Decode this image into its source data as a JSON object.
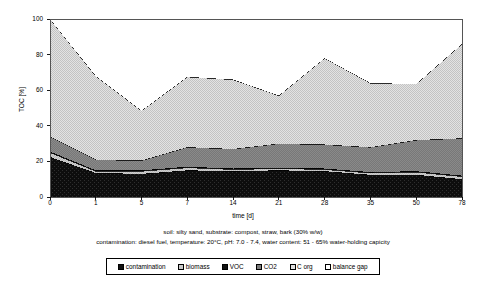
{
  "chart_data": {
    "type": "area",
    "title": "",
    "xlabel": "time [d]",
    "ylabel": "TOC [%]",
    "x": [
      0,
      1,
      5,
      7,
      14,
      21,
      28,
      35,
      50,
      78
    ],
    "xtick_labels": [
      "0",
      "1",
      "5",
      "7",
      "14",
      "21",
      "28",
      "35",
      "50",
      "78"
    ],
    "ytick_labels": [
      "0",
      "20",
      "40",
      "60",
      "80",
      "100"
    ],
    "yticks": [
      0,
      20,
      40,
      60,
      80,
      100
    ],
    "ylim": [
      0,
      100
    ],
    "grid": false,
    "stacked": true,
    "legend_position": "bottom",
    "series": [
      {
        "name": "contamination",
        "color": "#111111",
        "pattern": "solid-dark",
        "values": [
          22.5,
          13.5,
          13.0,
          15.0,
          14.5,
          15.0,
          14.5,
          12.5,
          12.5,
          10.0
        ]
      },
      {
        "name": "biomass",
        "color": "#b8b8b8",
        "pattern": "light-gray",
        "values": [
          2.5,
          1.0,
          1.5,
          1.5,
          1.0,
          1.0,
          1.0,
          1.0,
          1.5,
          1.5
        ]
      },
      {
        "name": "VOC",
        "color": "#1a1a1a",
        "pattern": "solid-dark",
        "values": [
          0.5,
          0.5,
          0.5,
          0.5,
          0.5,
          0.5,
          0.5,
          0.5,
          0.5,
          0.5
        ]
      },
      {
        "name": "CO2",
        "color": "#7a7a7a",
        "pattern": "medium-gray",
        "values": [
          8.5,
          6.0,
          5.5,
          11.0,
          11.0,
          13.5,
          13.5,
          14.0,
          17.5,
          21.0
        ]
      },
      {
        "name": "C org",
        "color": "#d4d4d4",
        "pattern": "checker-light",
        "values": [
          66.0,
          47.0,
          28.0,
          39.5,
          39.0,
          27.0,
          48.5,
          36.0,
          31.5,
          53.0
        ]
      },
      {
        "name": "balance gap",
        "color": "#ffffff",
        "pattern": "white",
        "values": [
          0.0,
          32.0,
          51.5,
          32.5,
          34.0,
          43.0,
          22.0,
          36.0,
          36.5,
          14.0
        ]
      }
    ],
    "cumulative_top_line": [
      100,
      68,
      48.5,
      67.5,
      66,
      57,
      78,
      64,
      63.5,
      86
    ],
    "caption_line_1": "soil: silty sand, substrate: compost, straw, bark (30% w/w)",
    "caption_line_2": "contamination: diesel fuel, temperature: 20°C, pH: 7.0 - 7.4, water content: 51 - 65% water-holding capicity"
  },
  "legend": {
    "items": [
      {
        "label": "contamination"
      },
      {
        "label": "biomass"
      },
      {
        "label": "VOC"
      },
      {
        "label": "CO2"
      },
      {
        "label": "C org"
      },
      {
        "label": "balance gap"
      }
    ]
  }
}
